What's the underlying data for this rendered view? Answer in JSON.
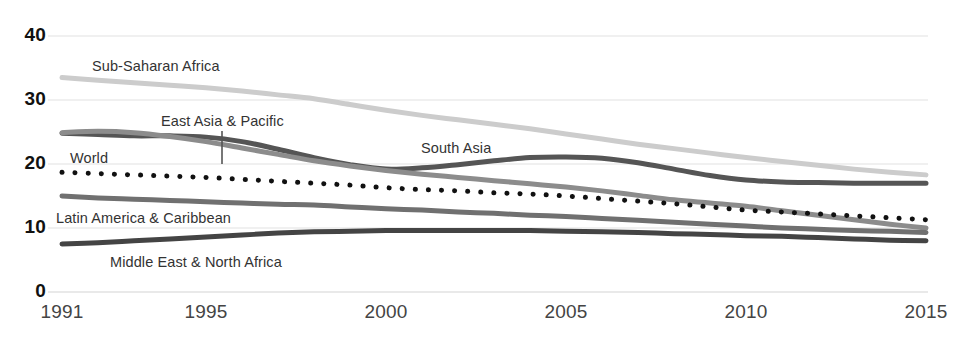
{
  "chart_data": {
    "type": "line",
    "title": "",
    "subtitle": "",
    "xlabel": "",
    "ylabel": "",
    "xlim": [
      1991,
      2015
    ],
    "ylim": [
      0,
      40
    ],
    "grid": true,
    "legend_position": "inline-labels",
    "x": [
      1991,
      1992,
      1993,
      1994,
      1995,
      1996,
      1997,
      1998,
      1999,
      2000,
      2001,
      2002,
      2003,
      2004,
      2005,
      2006,
      2007,
      2008,
      2009,
      2010,
      2011,
      2012,
      2013,
      2014,
      2015
    ],
    "y_ticks": [
      "40",
      "30",
      "20",
      "10",
      "0"
    ],
    "y_tick_values": [
      40,
      30,
      20,
      10,
      0
    ],
    "x_ticks": [
      "1991",
      "1995",
      "2000",
      "2005",
      "2010",
      "2015"
    ],
    "x_tick_values": [
      1991,
      1995,
      2000,
      2005,
      2010,
      2015
    ],
    "series": [
      {
        "name": "Sub-Saharan Africa",
        "color": "#cccccc",
        "style": "solid",
        "width": 5,
        "label_x": 92,
        "label_y": 58,
        "values": [
          33.5,
          33.1,
          32.7,
          32.3,
          31.9,
          31.4,
          30.8,
          30.2,
          29.3,
          28.4,
          27.6,
          26.9,
          26.2,
          25.5,
          24.7,
          23.9,
          23.1,
          22.4,
          21.7,
          21.0,
          20.4,
          19.8,
          19.2,
          18.7,
          18.3
        ]
      },
      {
        "name": "South Asia",
        "color": "#555555",
        "style": "solid",
        "width": 5,
        "label_x": 421,
        "label_y": 140,
        "values": [
          24.8,
          24.6,
          24.4,
          24.4,
          24.2,
          23.5,
          22.3,
          21.0,
          19.9,
          19.2,
          19.4,
          19.9,
          20.5,
          21.0,
          21.1,
          20.9,
          20.2,
          19.2,
          18.2,
          17.5,
          17.2,
          17.1,
          17.0,
          17.0,
          17.0
        ]
      },
      {
        "name": "East Asia & Pacific",
        "color": "#8c8c8c",
        "style": "solid",
        "width": 5,
        "label_x": 161,
        "label_y": 113,
        "leader_x": 222,
        "leader_y1": 131,
        "leader_y2": 164,
        "values": [
          24.9,
          25.1,
          24.9,
          24.3,
          23.5,
          22.5,
          21.5,
          20.5,
          19.7,
          19.0,
          18.4,
          17.9,
          17.4,
          16.9,
          16.4,
          15.8,
          15.1,
          14.4,
          13.9,
          13.4,
          12.7,
          12.0,
          11.3,
          10.6,
          10.0
        ]
      },
      {
        "name": "World",
        "color": "#111111",
        "style": "dotted",
        "width": 5,
        "label_x": 70,
        "label_y": 150,
        "values": [
          18.7,
          18.5,
          18.3,
          18.1,
          17.9,
          17.6,
          17.3,
          17.0,
          16.7,
          16.3,
          16.0,
          15.8,
          15.5,
          15.3,
          15.0,
          14.6,
          14.2,
          13.8,
          13.3,
          12.8,
          12.5,
          12.2,
          11.9,
          11.6,
          11.3
        ]
      },
      {
        "name": "Latin America & Caribbean",
        "color": "#707070",
        "style": "solid",
        "width": 5,
        "label_x": 56,
        "label_y": 210,
        "values": [
          15.0,
          14.7,
          14.5,
          14.3,
          14.1,
          13.9,
          13.7,
          13.6,
          13.3,
          13.0,
          12.8,
          12.5,
          12.3,
          12.0,
          11.8,
          11.5,
          11.2,
          10.9,
          10.6,
          10.3,
          10.0,
          9.8,
          9.6,
          9.5,
          9.3
        ]
      },
      {
        "name": "Middle East & North Africa",
        "color": "#444444",
        "style": "solid",
        "width": 5,
        "label_x": 110,
        "label_y": 254,
        "values": [
          7.5,
          7.7,
          8.0,
          8.3,
          8.6,
          8.9,
          9.2,
          9.4,
          9.5,
          9.6,
          9.6,
          9.6,
          9.6,
          9.6,
          9.5,
          9.4,
          9.3,
          9.1,
          9.0,
          8.8,
          8.7,
          8.5,
          8.3,
          8.1,
          8.0
        ]
      }
    ],
    "axis": {
      "grid_color": "#e2e2e2",
      "plot_left": 62,
      "plot_right": 926,
      "plot_top": 36,
      "plot_bottom": 292
    }
  }
}
